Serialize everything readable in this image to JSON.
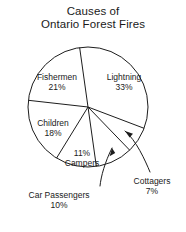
{
  "title": {
    "line1": "Causes of",
    "line2": "Ontario Forest Fires"
  },
  "chart_data": {
    "type": "pie",
    "title": "Causes of Ontario Forest Fires",
    "subtitle": "",
    "xlabel": "",
    "ylabel": "",
    "grid": false,
    "legend": "none",
    "labels_inline": true,
    "units": "percent",
    "total": 100,
    "categories": [
      "Lightning",
      "Cottagers",
      "Car Passengers",
      "Campers",
      "Children",
      "Fishermen"
    ],
    "values": [
      33,
      7,
      10,
      11,
      18,
      21
    ],
    "slices": [
      {
        "name": "Lightning",
        "percent": 33,
        "label_name": "Lightning",
        "label_pct": "33%",
        "start_deg": -8,
        "end_deg": 110.8,
        "leader": false
      },
      {
        "name": "Cottagers",
        "percent": 7,
        "label_name": "Cottagers",
        "label_pct": "7%",
        "start_deg": 110.8,
        "end_deg": 136.0,
        "leader": true
      },
      {
        "name": "Car Passengers",
        "percent": 10,
        "label_name": "Car Passengers",
        "label_pct": "10%",
        "start_deg": 136.0,
        "end_deg": 172.0,
        "leader": true
      },
      {
        "name": "Campers",
        "percent": 11,
        "label_name": "Campers",
        "label_pct": "11%",
        "label_order": "pct-first",
        "start_deg": 172.0,
        "end_deg": 211.6,
        "leader": false
      },
      {
        "name": "Children",
        "percent": 18,
        "label_name": "Children",
        "label_pct": "18%",
        "start_deg": 211.6,
        "end_deg": 276.4,
        "leader": false
      },
      {
        "name": "Fishermen",
        "percent": 21,
        "label_name": "Fishermen",
        "label_pct": "21%",
        "start_deg": 276.4,
        "end_deg": 352.0,
        "leader": false
      }
    ],
    "colors": {
      "stroke": "#1d1d1d",
      "fill": "#ffffff",
      "text": "#1a1a1a",
      "background": "#ffffff"
    }
  }
}
